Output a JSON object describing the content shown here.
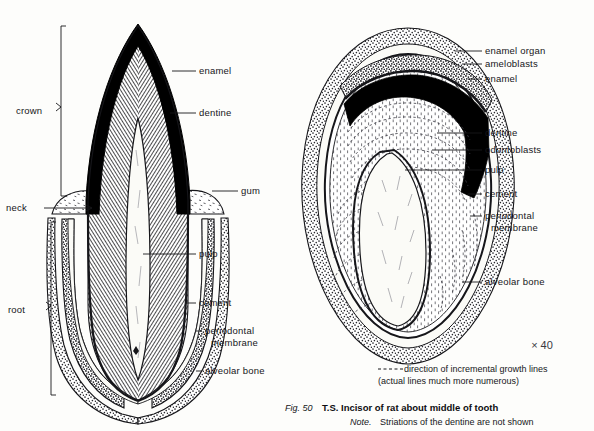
{
  "figure": {
    "caption_fig_number": "Fig. 50",
    "caption_title": "T.S. Incisor of rat about middle of tooth",
    "caption_note_prefix": "Note.",
    "caption_note_text": "Striations of the dentine are not shown",
    "magnification": "× 40",
    "legend_line1": "direction of incremental growth lines",
    "legend_line2": "(actual lines much more numerous)"
  },
  "left_diagram": {
    "name": "longitudinal-section-of-tooth",
    "brackets": [
      {
        "label": "crown"
      },
      {
        "label": "root"
      }
    ],
    "labels": [
      {
        "label": "enamel"
      },
      {
        "label": "dentine"
      },
      {
        "label": "gum"
      },
      {
        "label": "neck"
      },
      {
        "label": "pulp"
      },
      {
        "label": "cement"
      },
      {
        "label": "periodontal"
      },
      {
        "label": "membrane"
      },
      {
        "label": "alveolar bone"
      }
    ]
  },
  "right_diagram": {
    "name": "transverse-section-of-incisor",
    "labels": [
      {
        "label": "enamel organ"
      },
      {
        "label": "ameloblasts"
      },
      {
        "label": "enamel"
      },
      {
        "label": "dentine"
      },
      {
        "label": "odontoblasts"
      },
      {
        "label": "pulp"
      },
      {
        "label": "cement"
      },
      {
        "label": "periodontal"
      },
      {
        "label": "membrane"
      },
      {
        "label": "alveolar bone"
      }
    ]
  },
  "colors": {
    "ink": "#16161a",
    "enamel_black": "#000000",
    "page": "#fdfdfb",
    "pulp_white": "#fbfbf7",
    "bone_stipple": "#2a2a2e"
  }
}
